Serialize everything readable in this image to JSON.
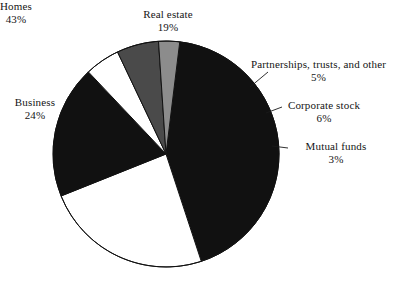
{
  "chart_data": {
    "type": "pie",
    "title": "",
    "subtitle": "",
    "xlabel": "",
    "ylabel": "",
    "legend_position": "callout-labels",
    "grid": false,
    "value_suffix": "%",
    "total": 100,
    "categories": [
      "Homes",
      "Business",
      "Real estate",
      "Corporate stock",
      "Partnerships, trusts, and other",
      "Mutual funds"
    ],
    "values": [
      43,
      24,
      19,
      6,
      5,
      3
    ],
    "slices": [
      {
        "id": "homes",
        "label": "Homes",
        "value": 43,
        "value_text": "43%",
        "color": "#111111",
        "start_angle": 7,
        "end_angle": 161.8
      },
      {
        "id": "business",
        "label": "Business",
        "value": 24,
        "value_text": "24%",
        "color": "#ffffff",
        "start_angle": 161.8,
        "end_angle": 248.2
      },
      {
        "id": "real-estate",
        "label": "Real estate",
        "value": 19,
        "value_text": "19%",
        "color": "#111111",
        "start_angle": 248.2,
        "end_angle": 316.6
      },
      {
        "id": "partnerships",
        "label": "Partnerships, trusts, and other",
        "value": 5,
        "value_text": "5%",
        "color": "#ffffff",
        "start_angle": 316.6,
        "end_angle": 334.6
      },
      {
        "id": "corporate-stock",
        "label": "Corporate stock",
        "value": 6,
        "value_text": "6%",
        "color": "#4a4a4a",
        "start_angle": 334.6,
        "end_angle": 356.2
      },
      {
        "id": "mutual-funds",
        "label": "Mutual funds",
        "value": 3,
        "value_text": "3%",
        "color": "#8c8c8c",
        "start_angle": 356.2,
        "end_angle": 367
      }
    ],
    "geometry": {
      "center_x": 166,
      "center_y": 154,
      "radius": 113,
      "stroke": "#111111",
      "stroke_width": 1
    }
  },
  "labels": {
    "real_estate": {
      "name": "Real estate",
      "pct": "19%"
    },
    "partnerships": {
      "name": "Partnerships, trusts, and other",
      "pct": "5%"
    },
    "corporate_stock": {
      "name": "Corporate stock",
      "pct": "6%"
    },
    "mutual_funds": {
      "name": "Mutual funds",
      "pct": "3%"
    },
    "business": {
      "name": "Business",
      "pct": "24%"
    },
    "homes": {
      "name": "Homes",
      "pct": "43%"
    }
  }
}
